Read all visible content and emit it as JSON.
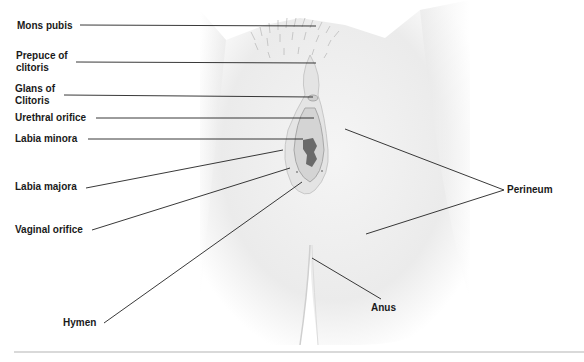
{
  "figure": {
    "type": "anatomical labeled illustration"
  },
  "labels": {
    "mons_pubis": "Mons pubis",
    "prepuce_of_clitoris": "Prepuce of\nclitoris",
    "glans_of_clitoris": "Glans of\nClitoris",
    "urethral_orifice": "Urethral orifice",
    "labia_minora": "Labia minora",
    "labia_majora": "Labia majora",
    "vaginal_orifice": "Vaginal orifice",
    "hymen": "Hymen",
    "perineum": "Perineum",
    "anus": "Anus"
  },
  "colors": {
    "background": "#ffffff",
    "leader_line": "#222222",
    "skin_light": "#f3f3f3",
    "skin_shade": "#d8d8d8",
    "opening": "#6a6a6a",
    "divider": "#d9d9d9"
  }
}
